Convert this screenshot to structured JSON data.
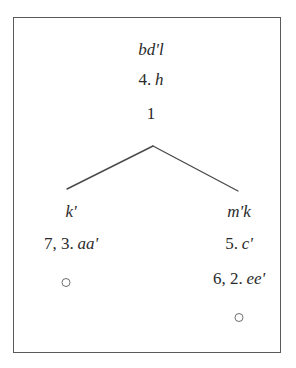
{
  "figure": {
    "type": "stemma-diagram",
    "frame": {
      "border_color": "#5a5a5a",
      "background_color": "#ffffff"
    },
    "ink_color": "#2b2b2b"
  },
  "nodes": {
    "root": {
      "name": "bd'l",
      "number": "4.",
      "sigil": "h"
    },
    "apex": {
      "number": "1"
    },
    "left_branch": {
      "name": "k'",
      "entries": [
        {
          "numbers": "7, 3.",
          "sigil": "aa'"
        }
      ],
      "terminal": "open-circle"
    },
    "right_branch": {
      "name": "m'k",
      "entries": [
        {
          "numbers": "5.",
          "sigil": "c'"
        },
        {
          "numbers": "6, 2.",
          "sigil": "ee'"
        }
      ],
      "terminal": "open-circle"
    }
  },
  "connector": {
    "apex_point": [
      152,
      145
    ],
    "left_endpoint": [
      66,
      188
    ],
    "right_endpoint": [
      237,
      190
    ],
    "stroke_color": "#4a4a4a",
    "stroke_width": 1.4
  }
}
